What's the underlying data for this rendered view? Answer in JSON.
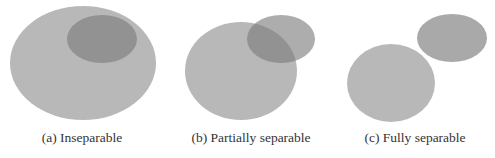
{
  "colors": {
    "large_set": "#b8b8b8",
    "small_set": "#9a9a9a",
    "small_set_alone_c": "#a9a9a9",
    "background": "#ffffff",
    "caption_text": "#333333"
  },
  "panels": [
    {
      "id": "a",
      "caption": "(a) Inseparable",
      "large": {
        "cx": 83,
        "cy": 63,
        "rx": 73,
        "ry": 57
      },
      "small": {
        "cx": 102,
        "cy": 39,
        "rx": 35,
        "ry": 24
      },
      "caption_x": 82
    },
    {
      "id": "b",
      "caption": "(b) Partially separable",
      "large": {
        "cx": 241,
        "cy": 71,
        "rx": 56,
        "ry": 49
      },
      "small": {
        "cx": 281,
        "cy": 39,
        "rx": 34,
        "ry": 24
      },
      "caption_x": 251
    },
    {
      "id": "c",
      "caption": "(c) Fully separable",
      "large": {
        "cx": 391,
        "cy": 83,
        "rx": 44,
        "ry": 39
      },
      "small": {
        "cx": 452,
        "cy": 38,
        "rx": 35,
        "ry": 24
      },
      "caption_x": 415
    }
  ]
}
